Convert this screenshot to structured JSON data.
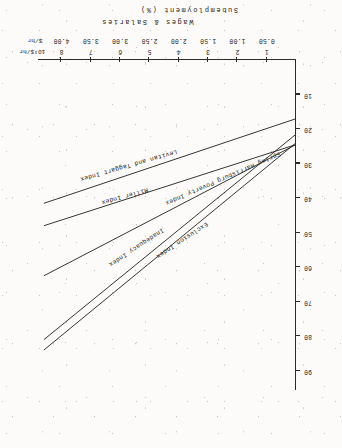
{
  "page": {
    "orientation_note": "figure printed upside-down (rotated 180 degrees) on scanned page",
    "background": "#fcfbf9",
    "ink": "#2b2b2b"
  },
  "chart_data": {
    "type": "line",
    "title": "",
    "xlabel": "Wages & Salaries",
    "ylabel": "Subemployment (%)",
    "x_unit_primary": "10³$/hr",
    "x_unit_secondary": "$/hr",
    "xlim": [
      0,
      8.8
    ],
    "ylim": [
      0,
      95
    ],
    "grid": false,
    "legend": "inline-curve-labels",
    "xticks_primary": [
      "1",
      "2",
      "3",
      "4",
      "5",
      "6",
      "7",
      "8"
    ],
    "xticks_primary_values": [
      1,
      2,
      3,
      4,
      5,
      6,
      7,
      8
    ],
    "xticks_secondary": [
      "0.50",
      "1.00",
      "1.50",
      "2.00",
      "2.50",
      "3.00",
      "3.50",
      "4.00"
    ],
    "xticks_secondary_values": [
      0.5,
      1.0,
      1.5,
      2.0,
      2.5,
      3.0,
      3.5,
      4.0
    ],
    "yticks": [
      "10",
      "20",
      "30",
      "40",
      "50",
      "60",
      "70",
      "80",
      "90"
    ],
    "ytick_values": [
      10,
      20,
      30,
      40,
      50,
      60,
      70,
      80,
      90
    ],
    "series": [
      {
        "name": "Exclusion Index",
        "label": "Exclusion Index",
        "x": [
          0.0,
          8.6
        ],
        "values": [
          24.0,
          84.0
        ],
        "color": "#2b2b2b",
        "label_x": 3.05,
        "label_y": 48.5,
        "label_angle": -33.5
      },
      {
        "name": "Inadequacy Index",
        "label": "Inadequacy Index",
        "x": [
          0.0,
          8.6
        ],
        "values": [
          21.5,
          81.0
        ],
        "color": "#2b2b2b",
        "label_x": 4.55,
        "label_y": 50.0,
        "label_angle": -33.5
      },
      {
        "name": "Spring Harrisburg Poverty Index",
        "label": "Spring Harrisburg Poverty Index",
        "x": [
          0.0,
          8.6
        ],
        "values": [
          24.5,
          62.5
        ],
        "color": "#2b2b2b",
        "label_x": 0.55,
        "label_y": 28.0,
        "label_angle": -23.5
      },
      {
        "name": "Miller Index",
        "label": "Miller Index",
        "x": [
          0.0,
          8.6
        ],
        "values": [
          24.5,
          48.0
        ],
        "color": "#2b2b2b",
        "label_x": 5.05,
        "label_y": 38.5,
        "label_angle": -15.5
      },
      {
        "name": "Levitan and Taggart Index",
        "label": "Levitan and Taggart Index",
        "x": [
          0.0,
          8.6
        ],
        "values": [
          17.0,
          41.5
        ],
        "color": "#2b2b2b",
        "label_x": 4.05,
        "label_y": 27.5,
        "label_angle": -16.0
      }
    ]
  }
}
